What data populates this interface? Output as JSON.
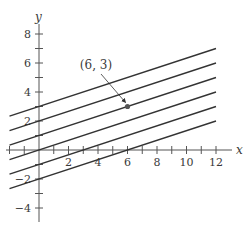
{
  "chart_data": {
    "type": "line",
    "title": "",
    "xlabel": "x",
    "ylabel": "y",
    "xlim": [
      -2,
      12
    ],
    "ylim": [
      -4.8,
      9.5
    ],
    "grid": false,
    "x_ticks": [
      -2,
      -1,
      1,
      2,
      3,
      4,
      5,
      6,
      7,
      8,
      9,
      10,
      11,
      12
    ],
    "x_tick_labels": [
      {
        "value": 2,
        "label": "2"
      },
      {
        "value": 4,
        "label": "4"
      },
      {
        "value": 6,
        "label": "6"
      },
      {
        "value": 8,
        "label": "8"
      },
      {
        "value": 10,
        "label": "10"
      },
      {
        "value": 12,
        "label": "12"
      }
    ],
    "y_ticks": [
      -4,
      -3,
      -2,
      -1,
      1,
      2,
      3,
      4,
      5,
      6,
      7,
      8
    ],
    "y_tick_labels": [
      {
        "value": 8,
        "label": "8"
      },
      {
        "value": 6,
        "label": "6"
      },
      {
        "value": 4,
        "label": "4"
      },
      {
        "value": 2,
        "label": "2"
      },
      {
        "value": -2,
        "label": "−2"
      },
      {
        "value": -4,
        "label": "−4"
      }
    ],
    "series": [
      {
        "name": "y = x/3 + 3",
        "slope": 0.3333,
        "intercept": 3,
        "x": [
          -2,
          12
        ],
        "y": [
          2.333,
          7
        ]
      },
      {
        "name": "y = x/3 + 2",
        "slope": 0.3333,
        "intercept": 2,
        "x": [
          -2,
          12
        ],
        "y": [
          1.333,
          6
        ]
      },
      {
        "name": "y = x/3 + 1",
        "slope": 0.3333,
        "intercept": 1,
        "x": [
          -2,
          12
        ],
        "y": [
          0.333,
          5
        ]
      },
      {
        "name": "y = x/3",
        "slope": 0.3333,
        "intercept": 0,
        "x": [
          -2,
          12
        ],
        "y": [
          -0.667,
          4
        ]
      },
      {
        "name": "y = x/3 - 1",
        "slope": 0.3333,
        "intercept": -1,
        "x": [
          -2,
          12
        ],
        "y": [
          -1.667,
          3
        ]
      },
      {
        "name": "y = x/3 - 2",
        "slope": 0.3333,
        "intercept": -2,
        "x": [
          -2,
          12
        ],
        "y": [
          -2.667,
          2
        ]
      }
    ],
    "points": [
      {
        "x": 6,
        "y": 3,
        "label": "(6, 3)"
      }
    ],
    "annotations": [
      {
        "text": "(6, 3)",
        "target": {
          "x": 6,
          "y": 3
        },
        "arrow": true
      }
    ],
    "colors": {
      "line": "#333333",
      "axis": "#555555",
      "point": "#555555"
    }
  }
}
